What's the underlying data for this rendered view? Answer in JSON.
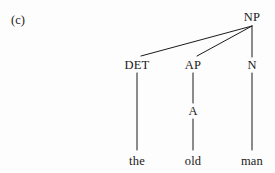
{
  "figure": {
    "panel_label": "(c)",
    "background_color": "#fdfdfd",
    "ink_color": "#1a1a1a",
    "width": 275,
    "height": 173
  },
  "tree": {
    "root": {
      "label": "NP",
      "x": 252,
      "y": 17
    },
    "categories": [
      {
        "label": "DET",
        "x": 137,
        "y": 65
      },
      {
        "label": "AP",
        "x": 193,
        "y": 65
      },
      {
        "label": "N",
        "x": 252,
        "y": 65
      },
      {
        "label": "A",
        "x": 193,
        "y": 111
      }
    ],
    "leaves": [
      {
        "label": "the",
        "x": 137,
        "y": 161
      },
      {
        "label": "old",
        "x": 193,
        "y": 161
      },
      {
        "label": "man",
        "x": 252,
        "y": 161
      }
    ],
    "edges": [
      {
        "from": "NP",
        "to": "DET",
        "x1": 252,
        "y1": 26,
        "x2": 141,
        "y2": 56
      },
      {
        "from": "NP",
        "to": "AP",
        "x1": 252,
        "y1": 26,
        "x2": 197,
        "y2": 56
      },
      {
        "from": "NP",
        "to": "N",
        "x1": 252,
        "y1": 26,
        "x2": 252,
        "y2": 57
      },
      {
        "from": "DET",
        "to": "the",
        "x1": 137,
        "y1": 73,
        "x2": 137,
        "y2": 150
      },
      {
        "from": "AP",
        "to": "A",
        "x1": 193,
        "y1": 73,
        "x2": 193,
        "y2": 103
      },
      {
        "from": "A",
        "to": "old",
        "x1": 193,
        "y1": 119,
        "x2": 193,
        "y2": 150
      },
      {
        "from": "N",
        "to": "man",
        "x1": 252,
        "y1": 73,
        "x2": 252,
        "y2": 150
      }
    ]
  }
}
